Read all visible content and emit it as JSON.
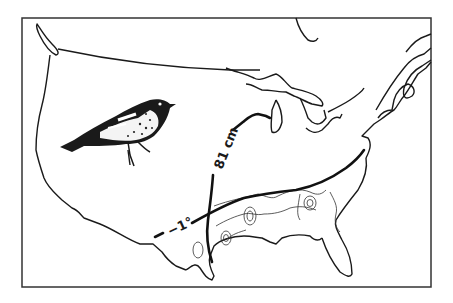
{
  "figure": {
    "type": "range-map illustration",
    "colors": {
      "ink": "#1a1a1a",
      "background": "#ffffff",
      "frame": "#333333"
    },
    "isolines": [
      {
        "id": "precipitation",
        "label": "81 cm"
      },
      {
        "id": "temperature",
        "label": "−1°"
      }
    ],
    "illustration": "songbird (warbler)"
  }
}
